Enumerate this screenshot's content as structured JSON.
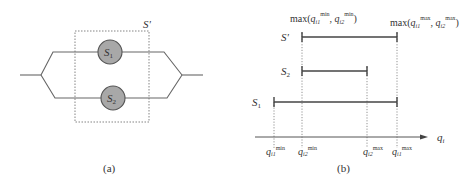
{
  "panel_a": {
    "caption": "(a)",
    "group_label": "S'",
    "nodes": [
      {
        "id": "S1",
        "label": "S",
        "sub": "1"
      },
      {
        "id": "S2",
        "label": "S",
        "sub": "2"
      }
    ]
  },
  "panel_b": {
    "caption": "(b)",
    "axis_label": {
      "base": "q",
      "sub": "i"
    },
    "top_annotations": {
      "left": {
        "prefix": "max(",
        "a": "q",
        "a_sub": "i1",
        "a_sup": "min",
        "sep": ", ",
        "b": "q",
        "b_sub": "i2",
        "b_sup": "min",
        "suffix": ")"
      },
      "right": {
        "prefix": "max(",
        "a": "q",
        "a_sub": "i1",
        "a_sup": "max",
        "sep": ", ",
        "b": "q",
        "b_sub": "i2",
        "b_sup": "max",
        "suffix": ")"
      }
    },
    "intervals": [
      {
        "name": "S'",
        "label": "S'",
        "sub": "",
        "from": "max(q_i1_min,q_i2_min)",
        "to": "max(q_i1_max,q_i2_max)"
      },
      {
        "name": "S2",
        "label": "S",
        "sub": "2",
        "from": "q_i2_min",
        "to": "q_i2_max"
      },
      {
        "name": "S1",
        "label": "S",
        "sub": "1",
        "from": "q_i1_min",
        "to": "q_i1_max"
      }
    ],
    "ticks": [
      {
        "base": "q",
        "sub": "i1",
        "sup": "min"
      },
      {
        "base": "q",
        "sub": "i2",
        "sup": "min"
      },
      {
        "base": "q",
        "sub": "i2",
        "sup": "max"
      },
      {
        "base": "q",
        "sub": "i1",
        "sup": "max"
      }
    ]
  },
  "colors": {
    "line": "#555555",
    "node_fill": "#a8a8a8",
    "node_stroke": "#555555",
    "text": "#333333"
  }
}
